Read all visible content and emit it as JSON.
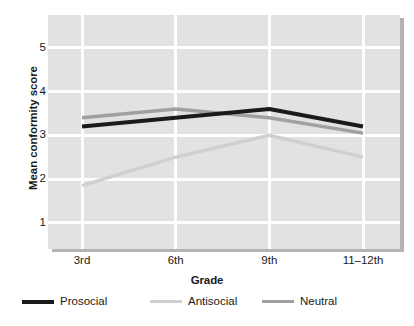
{
  "chart_data": {
    "type": "line",
    "title": "",
    "xlabel": "Grade",
    "ylabel": "Mean conformity score",
    "categories": [
      "3rd",
      "6th",
      "9th",
      "11–12th"
    ],
    "ylim": [
      0.4,
      5.75
    ],
    "yticks": [
      1,
      2,
      3,
      4,
      5
    ],
    "ytick_labels": [
      "1",
      "2",
      "3",
      "4",
      "5"
    ],
    "grid": "white gridlines on gray panel, horizontal at each y tick and vertical at each category",
    "legend_position": "below plot, horizontal",
    "series": [
      {
        "name": "Prosocial",
        "color": "#1a1a1a",
        "values": [
          3.2,
          3.4,
          3.6,
          3.2
        ]
      },
      {
        "name": "Antisocial",
        "color": "#d0d0d0",
        "values": [
          1.85,
          2.5,
          3.0,
          2.5
        ]
      },
      {
        "name": "Neutral",
        "color": "#a0a0a0",
        "values": [
          3.4,
          3.6,
          3.4,
          3.05
        ]
      }
    ]
  },
  "axis": {
    "y_title": "Mean conformity score",
    "x_title": "Grade"
  },
  "colors": {
    "panel_background": "#e2e2e2",
    "panel_shadow": "#b3b3b3",
    "gridline": "#ffffff",
    "text": "#1a1a1a",
    "prosocial": "#1a1a1a",
    "antisocial": "#d0d0d0",
    "neutral": "#a0a0a0"
  }
}
